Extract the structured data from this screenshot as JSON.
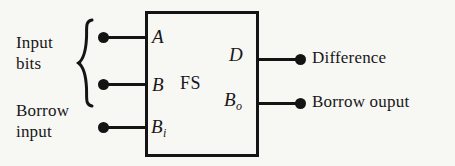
{
  "figure": {
    "kind": "logic-block-diagram",
    "background_color": "#f7f7f4",
    "ink_color": "#181818"
  },
  "block": {
    "name": "FS",
    "pins": {
      "input_a": "A",
      "input_b": "B",
      "input_borrow": "B",
      "input_borrow_sub": "i",
      "output_difference": "D",
      "output_borrow": "B",
      "output_borrow_sub": "o"
    }
  },
  "annotations": {
    "input_bits_line1": "Input",
    "input_bits_line2": "bits",
    "borrow_input_line1": "Borrow",
    "borrow_input_line2": "input",
    "difference": "Difference",
    "borrow_output": "Borrow ouput"
  }
}
